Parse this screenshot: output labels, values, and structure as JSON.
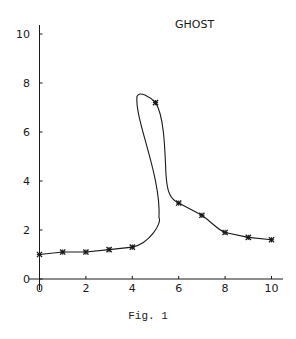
{
  "chart_data": {
    "type": "line",
    "title": "GHOST",
    "xlabel": "",
    "ylabel": "",
    "caption": "Fig. 1",
    "xlim": [
      0,
      10
    ],
    "ylim": [
      0,
      10
    ],
    "x_ticks": [
      0,
      2,
      4,
      6,
      8,
      10
    ],
    "y_ticks": [
      0,
      2,
      4,
      6,
      8,
      10
    ],
    "grid": false,
    "legend": null,
    "marker": "asterisk",
    "series": [
      {
        "name": "GHOST",
        "x": [
          0,
          1,
          2,
          3,
          4,
          5,
          6,
          7,
          8,
          9,
          10
        ],
        "y": [
          1.0,
          1.1,
          1.1,
          1.2,
          1.3,
          7.2,
          3.1,
          2.6,
          1.9,
          1.7,
          1.6
        ]
      }
    ],
    "annotations": [
      "Interpolating curve between x=4 and x=6 overshoots, forming a loop peaking near y=7.5 at x≈4.3"
    ]
  },
  "colors": {
    "line": "#1a1a1a",
    "background": "#ffffff"
  }
}
